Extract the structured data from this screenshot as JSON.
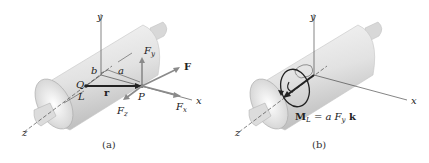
{
  "figure": {
    "panels": [
      {
        "id": "a",
        "caption": "(a)",
        "labels": {
          "y_axis": "y",
          "x_axis": "x",
          "z_axis": "z",
          "force": "F",
          "fy": "F",
          "fy_sub": "y",
          "fx": "F",
          "fx_sub": "x",
          "fz": "F",
          "fz_sub": "z",
          "point_q": "Q",
          "point_p": "P",
          "axis_l": "L",
          "position_vector": "r",
          "dim_a": "a",
          "dim_b": "b"
        }
      },
      {
        "id": "b",
        "caption": "(b)",
        "labels": {
          "y_axis": "y",
          "x_axis": "x",
          "z_axis": "z",
          "moment_m": "M",
          "moment_sub": "L",
          "moment_eq": " = a F",
          "moment_eq_sub": "y",
          "moment_k": " k"
        }
      }
    ],
    "colors": {
      "cylinder_light": "#f2f2f2",
      "cylinder_mid": "#d9d9d9",
      "cylinder_dark": "#b5b5b5",
      "vector_gray": "#8a8a8a",
      "axis_line": "#333333",
      "r_vector": "#222222"
    }
  }
}
